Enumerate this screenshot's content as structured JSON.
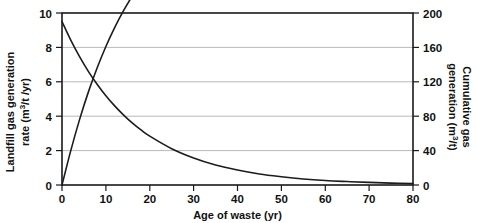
{
  "chart_data": {
    "type": "line",
    "title": "",
    "xlabel": "Age of waste (yr)",
    "ylabel": "Landfill gas generation rate (m3/t /yr)",
    "ylabel_line1": "Landfill gas generation",
    "ylabel_line2_pre": "rate (m",
    "ylabel_line2_sup": "3",
    "ylabel_line2_post": "/t /yr)",
    "y2label": "Cumulative gas generation (m3/t)",
    "y2label_line1": "Cumulative gas",
    "y2label_line2_pre": "generation (m",
    "y2label_line2_sup": "3",
    "y2label_line2_post": "/t)",
    "xlim": [
      0,
      80
    ],
    "ylim": [
      0,
      10
    ],
    "y2lim": [
      0,
      200
    ],
    "grid": true,
    "legend_position": "none",
    "xticks": [
      0,
      10,
      20,
      30,
      40,
      50,
      60,
      70,
      80
    ],
    "xtick_labels": [
      "0",
      "10",
      "20",
      "30",
      "40",
      "50",
      "60",
      "70",
      "80"
    ],
    "yticks": [
      0,
      2,
      4,
      6,
      8,
      10
    ],
    "ytick_labels": [
      "0",
      "2",
      "4",
      "6",
      "8",
      "10"
    ],
    "y2ticks": [
      0,
      40,
      80,
      120,
      160,
      200
    ],
    "y2tick_labels": [
      "0",
      "40",
      "80",
      "120",
      "160",
      "200"
    ],
    "x": [
      0,
      2,
      4,
      6,
      8,
      10,
      12,
      14,
      16,
      18,
      20,
      25,
      30,
      35,
      40,
      45,
      50,
      55,
      60,
      65,
      70,
      75,
      80
    ],
    "series": [
      {
        "name": "Landfill gas generation rate",
        "axis": "left",
        "units": "m3/t/yr",
        "values": [
          9.5,
          8.42,
          7.46,
          6.61,
          5.86,
          5.19,
          4.6,
          4.08,
          3.61,
          3.2,
          2.84,
          2.11,
          1.57,
          1.16,
          0.87,
          0.64,
          0.48,
          0.35,
          0.26,
          0.2,
          0.15,
          0.11,
          0.08
        ]
      },
      {
        "name": "Cumulative gas generation",
        "axis": "right",
        "units": "m3/t",
        "values": [
          0,
          35.5,
          67.0,
          94.9,
          119.6,
          141.5,
          160.8,
          177.9,
          193.0,
          206.4,
          218.2,
          241.8,
          258.4,
          270.2,
          278.5,
          284.3,
          288.4,
          291.4,
          293.5,
          295.0,
          296.1,
          296.8,
          297.4
        ],
        "values_displayed": [
          0,
          20.0,
          38.0,
          54.0,
          68.0,
          80.5,
          91.5,
          101.2,
          109.8,
          117.5,
          124.2,
          137.6,
          147.1,
          153.8,
          158.5,
          161.9,
          164.2,
          165.9,
          167.1,
          168.0,
          168.6,
          169.0,
          172.0
        ]
      }
    ],
    "annotations": [
      {
        "text": "curves cross near age 14 yr at rate 4.2 m3/t/yr"
      }
    ],
    "colors": {
      "curve": "#1c1c1c",
      "grid": "#b9b9b9",
      "frame": "#1a1a1a",
      "text": "#111111",
      "background": "#ffffff"
    }
  }
}
